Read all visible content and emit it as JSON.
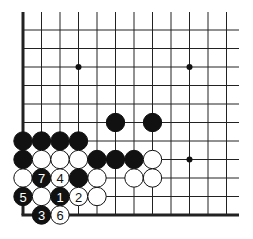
{
  "diagram": {
    "type": "go-board-fragment",
    "colors": {
      "board": "#ffffff",
      "line": "#222222",
      "black": "#111111",
      "white": "#ffffff"
    },
    "grid": {
      "cols": [
        23,
        41.5,
        60,
        78.5,
        97,
        115.5,
        134,
        152.5,
        171,
        189.5,
        208,
        226.5
      ],
      "rows": [
        30,
        48.5,
        67,
        85.5,
        104,
        122.5,
        141,
        159.5,
        178,
        196.5,
        215
      ],
      "right_extent": 239,
      "top_extent": 12
    },
    "star_points": [
      {
        "c": 3,
        "r": 2
      },
      {
        "c": 9,
        "r": 2
      },
      {
        "c": 9,
        "r": 7
      }
    ],
    "stones": [
      {
        "c": 5,
        "r": 5,
        "color": "black",
        "label": ""
      },
      {
        "c": 7,
        "r": 5,
        "color": "black",
        "label": ""
      },
      {
        "c": 0,
        "r": 6,
        "color": "black",
        "label": ""
      },
      {
        "c": 1,
        "r": 6,
        "color": "black",
        "label": ""
      },
      {
        "c": 2,
        "r": 6,
        "color": "black",
        "label": ""
      },
      {
        "c": 3,
        "r": 6,
        "color": "black",
        "label": ""
      },
      {
        "c": 0,
        "r": 7,
        "color": "black",
        "label": ""
      },
      {
        "c": 1,
        "r": 7,
        "color": "white",
        "label": ""
      },
      {
        "c": 2,
        "r": 7,
        "color": "white",
        "label": ""
      },
      {
        "c": 3,
        "r": 7,
        "color": "white",
        "label": ""
      },
      {
        "c": 4,
        "r": 7,
        "color": "black",
        "label": ""
      },
      {
        "c": 5,
        "r": 7,
        "color": "black",
        "label": ""
      },
      {
        "c": 6,
        "r": 7,
        "color": "black",
        "label": ""
      },
      {
        "c": 7,
        "r": 7,
        "color": "white",
        "label": ""
      },
      {
        "c": 0,
        "r": 8,
        "color": "white",
        "label": ""
      },
      {
        "c": 1,
        "r": 8,
        "color": "black",
        "label": "7"
      },
      {
        "c": 2,
        "r": 8,
        "color": "white",
        "label": "4"
      },
      {
        "c": 3,
        "r": 8,
        "color": "black",
        "label": ""
      },
      {
        "c": 4,
        "r": 8,
        "color": "white",
        "label": ""
      },
      {
        "c": 6,
        "r": 8,
        "color": "white",
        "label": ""
      },
      {
        "c": 7,
        "r": 8,
        "color": "white",
        "label": ""
      },
      {
        "c": 0,
        "r": 9,
        "color": "black",
        "label": "5"
      },
      {
        "c": 1,
        "r": 9,
        "color": "white",
        "label": ""
      },
      {
        "c": 2,
        "r": 9,
        "color": "black",
        "label": "1"
      },
      {
        "c": 3,
        "r": 9,
        "color": "white",
        "label": "2"
      },
      {
        "c": 4,
        "r": 9,
        "color": "white",
        "label": ""
      },
      {
        "c": 1,
        "r": 10,
        "color": "black",
        "label": "3"
      },
      {
        "c": 2,
        "r": 10,
        "color": "white",
        "label": "6"
      }
    ]
  }
}
